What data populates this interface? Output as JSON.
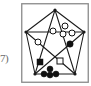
{
  "canvas": {
    "width": 91,
    "height": 86,
    "background": "#ffffff"
  },
  "edge_label": {
    "text": "7)",
    "color": "#6b6b6b"
  },
  "figure": {
    "title": "",
    "panel": {
      "x": 21,
      "y": 3,
      "width": 68,
      "height": 80,
      "border_color": "#8a8a8a",
      "fill": "#ffffff"
    },
    "stroke_color": "#1a1a1a",
    "marker_fill_dark": "#111111",
    "marker_fill_light": "#ffffff",
    "shape": {
      "name": "pentagram-in-square",
      "outer_polygon": "pentagon",
      "vertices": [
        {
          "name": "apex",
          "x": 34,
          "y": 7
        },
        {
          "name": "upper-right",
          "x": 63,
          "y": 29
        },
        {
          "name": "lower-right",
          "x": 54,
          "y": 71
        },
        {
          "name": "lower-left",
          "x": 14,
          "y": 71
        },
        {
          "name": "upper-left",
          "x": 5,
          "y": 29
        }
      ],
      "edges": [
        [
          0,
          1
        ],
        [
          1,
          2
        ],
        [
          2,
          3
        ],
        [
          3,
          4
        ],
        [
          4,
          0
        ],
        [
          0,
          2
        ],
        [
          0,
          3
        ],
        [
          1,
          3
        ],
        [
          1,
          4
        ],
        [
          2,
          4
        ]
      ],
      "vertex_dot_radius": 1.6
    },
    "markers": [
      {
        "name": "open-circle-left",
        "type": "circle",
        "fill": "open",
        "x": 17,
        "y": 39,
        "r": 3.0
      },
      {
        "name": "open-circle-center",
        "type": "circle",
        "fill": "open",
        "x": 32,
        "y": 28,
        "r": 3.0
      },
      {
        "name": "open-circle-upper",
        "type": "circle",
        "fill": "open",
        "x": 44,
        "y": 23,
        "r": 3.0
      },
      {
        "name": "open-circle-mid",
        "type": "circle",
        "fill": "open",
        "x": 42,
        "y": 31,
        "r": 3.0
      },
      {
        "name": "open-circle-right",
        "type": "circle",
        "fill": "open",
        "x": 51,
        "y": 30,
        "r": 3.0
      },
      {
        "name": "filled-circle-right",
        "type": "circle",
        "fill": "solid",
        "x": 49,
        "y": 41,
        "r": 3.2
      },
      {
        "name": "filled-square-left",
        "type": "square",
        "fill": "solid",
        "x": 19,
        "y": 59,
        "size": 6.0
      },
      {
        "name": "open-square-right",
        "type": "square",
        "fill": "open",
        "x": 39,
        "y": 58,
        "size": 6.0
      },
      {
        "name": "filled-circle-cluster-top",
        "type": "circle",
        "fill": "solid",
        "x": 29,
        "y": 66,
        "r": 3.0
      },
      {
        "name": "filled-circle-cluster-left",
        "type": "circle",
        "fill": "solid",
        "x": 23,
        "y": 71,
        "r": 3.0
      },
      {
        "name": "filled-circle-cluster-mid",
        "type": "circle",
        "fill": "solid",
        "x": 29,
        "y": 72,
        "r": 3.0
      },
      {
        "name": "filled-circle-cluster-right",
        "type": "circle",
        "fill": "solid",
        "x": 35,
        "y": 71,
        "r": 3.0
      }
    ]
  }
}
